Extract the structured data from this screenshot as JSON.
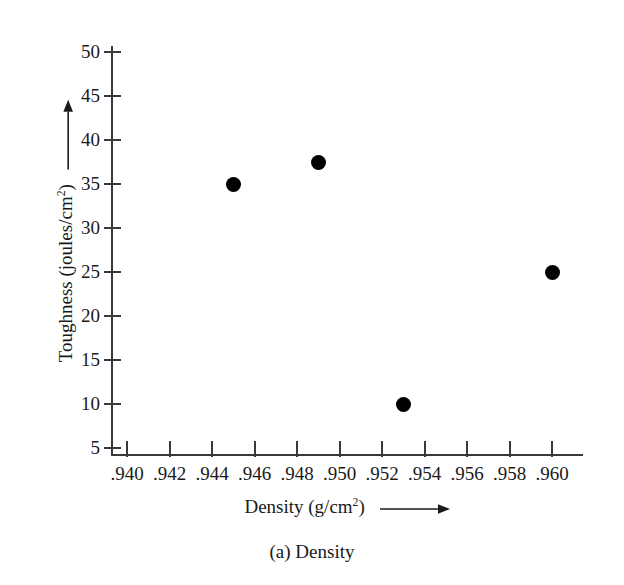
{
  "chart_data": {
    "type": "scatter",
    "title": "",
    "caption": "(a) Density",
    "xlabel": "Density (g/cm",
    "xlabel_sup": "2",
    "xlabel_suffix": ")",
    "ylabel": "Toughness (joules/cm",
    "ylabel_sup": "2",
    "ylabel_suffix": ")",
    "xlabel_full": "Density (g/cm2) ⟶",
    "ylabel_full": "Toughness (joules/cm2) ⟶",
    "x": [
      0.945,
      0.949,
      0.953,
      0.96
    ],
    "y": [
      35,
      37.5,
      10,
      25
    ],
    "points": [
      {
        "x": 0.945,
        "y": 35
      },
      {
        "x": 0.949,
        "y": 37.5
      },
      {
        "x": 0.953,
        "y": 10
      },
      {
        "x": 0.96,
        "y": 25
      }
    ],
    "xlim": [
      0.9395,
      0.9615
    ],
    "ylim": [
      5,
      50
    ],
    "xticks": [
      0.94,
      0.942,
      0.944,
      0.946,
      0.948,
      0.95,
      0.952,
      0.954,
      0.956,
      0.958,
      0.96
    ],
    "xtick_labels": [
      ".940",
      ".942",
      ".944",
      ".946",
      ".948",
      ".950",
      ".952",
      ".954",
      ".956",
      ".958",
      ".960"
    ],
    "yticks": [
      5,
      10,
      15,
      20,
      25,
      30,
      35,
      40,
      45,
      50
    ],
    "ytick_labels": [
      "5",
      "10",
      "15",
      "20",
      "25",
      "30",
      "35",
      "40",
      "45",
      "50"
    ],
    "grid": false,
    "legend": null,
    "marker_color": "#000000",
    "axis_color": "#3a3a3a",
    "background_color": "#ffffff"
  }
}
